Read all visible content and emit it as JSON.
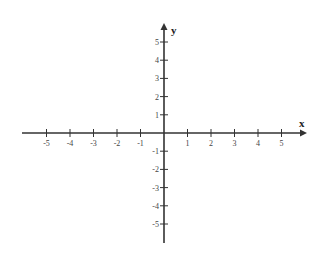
{
  "chart_data": {
    "type": "coordinate-plane",
    "title": "",
    "xlabel": "x",
    "ylabel": "y",
    "xlim": [
      -5,
      5
    ],
    "ylim": [
      -5,
      5
    ],
    "x_ticks": [
      -5,
      -4,
      -3,
      -2,
      -1,
      1,
      2,
      3,
      4,
      5
    ],
    "y_ticks": [
      5,
      4,
      3,
      2,
      1,
      -1,
      -2,
      -3,
      -4,
      -5
    ],
    "grid": false,
    "arrows": [
      "positive-x",
      "positive-y"
    ],
    "series": []
  },
  "plane": {
    "x_axis_label": "x",
    "y_axis_label": "y",
    "x_tick_labels": [
      "-5",
      "-4",
      "-3",
      "-2",
      "-1",
      "1",
      "2",
      "3",
      "4",
      "5"
    ],
    "y_tick_labels": [
      "5",
      "4",
      "3",
      "2",
      "1",
      "-1",
      "-2",
      "-3",
      "-4",
      "-5"
    ]
  }
}
